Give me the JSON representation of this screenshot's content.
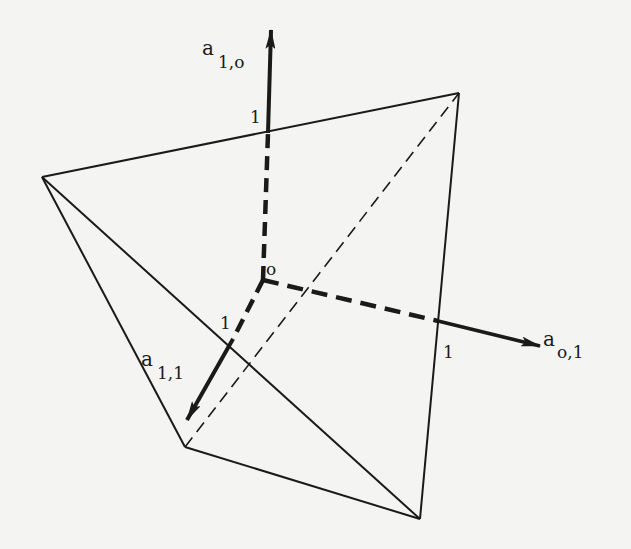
{
  "diagram": {
    "origin_label": "o",
    "axes": [
      {
        "name": "a_1,0",
        "base": "a",
        "subscript": "1,o",
        "unit_tick": "1"
      },
      {
        "name": "a_0,1",
        "base": "a",
        "subscript": "o,1",
        "unit_tick": "1"
      },
      {
        "name": "a_1,1",
        "base": "a",
        "subscript": "1,1",
        "unit_tick": "1"
      }
    ],
    "vertices": {
      "left": [
        42,
        177
      ],
      "top_right": [
        459,
        93
      ],
      "bottom_left": [
        185,
        447
      ],
      "bottom_right": [
        420,
        519
      ]
    },
    "origin_point": [
      263,
      280
    ],
    "colors": {
      "ink": "#1a1a1a",
      "paper": "#f4f4f2"
    }
  }
}
